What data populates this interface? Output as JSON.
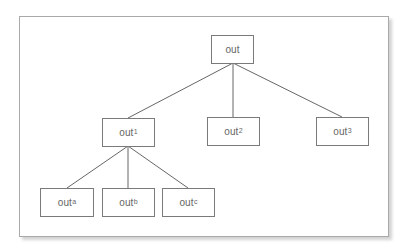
{
  "diagram": {
    "type": "tree",
    "style": {
      "line_color": "#666666",
      "box_border": "#7a7a7a",
      "text_color": "#666666",
      "frame_border": "#a9a9a9"
    },
    "nodes": {
      "root": {
        "label": "out",
        "sup": ""
      },
      "n1": {
        "label": "out",
        "sup": "1"
      },
      "n2": {
        "label": "out",
        "sup": "2"
      },
      "n3": {
        "label": "out",
        "sup": "3"
      },
      "na": {
        "label": "out",
        "sup": "a"
      },
      "nb": {
        "label": "out",
        "sup": "b"
      },
      "nc": {
        "label": "out",
        "sup": "c"
      }
    },
    "edges": [
      [
        "root",
        "n1"
      ],
      [
        "root",
        "n2"
      ],
      [
        "root",
        "n3"
      ],
      [
        "n1",
        "na"
      ],
      [
        "n1",
        "nb"
      ],
      [
        "n1",
        "nc"
      ]
    ]
  }
}
